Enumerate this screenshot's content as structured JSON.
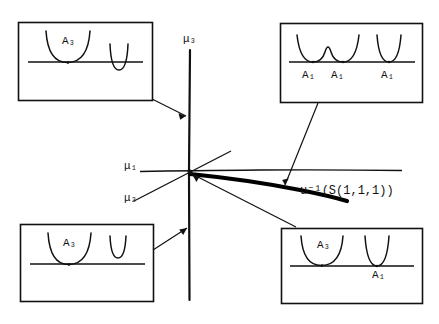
{
  "figure": {
    "title": "",
    "type": "mathematical-stratification-diagram"
  },
  "axes_labels": {
    "mu1": "μ₁",
    "mu2": "μ₂",
    "mu3": "μ₃"
  },
  "curve_label": {
    "text": "u⁻¹(S(1,1,1))",
    "base": "u",
    "exponent": "-1",
    "argument": "(S(1,1,1))"
  },
  "boxes": {
    "top_left": {
      "name": "top-left-inset",
      "labels": [
        "A₃"
      ],
      "strata_labels": [
        {
          "text": "A₃",
          "x": 68,
          "y": 41
        }
      ]
    },
    "top_right": {
      "name": "top-right-inset",
      "labels": [
        "A₁",
        "A₁",
        "A₁"
      ],
      "strata_labels": [
        {
          "text": "A₁",
          "x": 308,
          "y": 75
        },
        {
          "text": "A₁",
          "x": 337,
          "y": 75
        },
        {
          "text": "A₁",
          "x": 387,
          "y": 75
        }
      ]
    },
    "bottom_left": {
      "name": "bottom-left-inset",
      "labels": [
        "A₃"
      ],
      "strata_labels": [
        {
          "text": "A₃",
          "x": 68,
          "y": 243
        }
      ]
    },
    "bottom_right": {
      "name": "bottom-right-inset",
      "labels": [
        "A₃",
        "A₁"
      ],
      "strata_labels": [
        {
          "text": "A₃",
          "x": 323,
          "y": 243
        },
        {
          "text": "A₁",
          "x": 380,
          "y": 272
        }
      ]
    }
  },
  "colors": {
    "ink": "#111111",
    "background": "#ffffff",
    "thick_curve": "#000000"
  },
  "geometry": {
    "canvas": {
      "width": 439,
      "height": 324
    },
    "center_point": {
      "x": 190,
      "y": 172
    },
    "mu3_line": {
      "x": 190,
      "y_top": 50,
      "y_bottom": 300
    },
    "mu1_line": {
      "y": 171,
      "x_left": 140,
      "x_right": 402
    },
    "mu2_line": {
      "x1": 134,
      "y1": 201,
      "x2": 231,
      "y2": 151
    }
  }
}
